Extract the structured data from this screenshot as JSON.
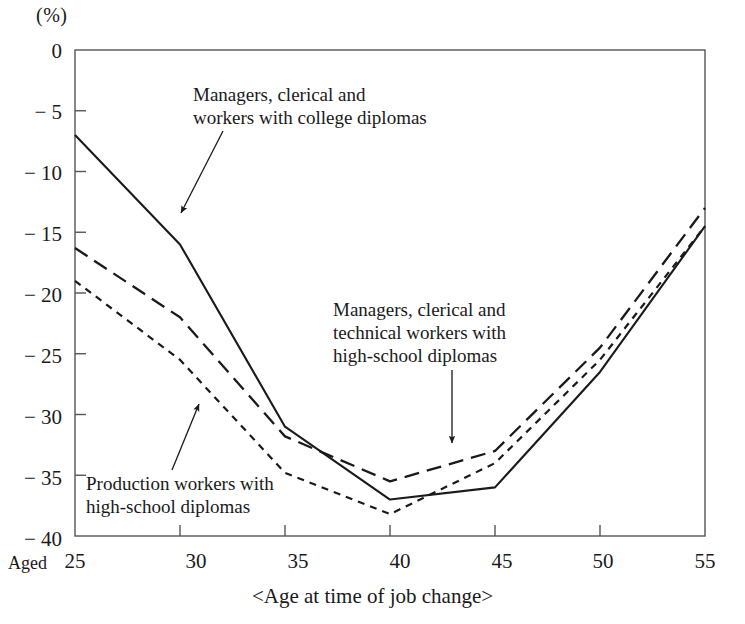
{
  "axes": {
    "unit_label": "(%)",
    "x_axis_title": "<Age at time of job change>",
    "aged_prefix": "Aged",
    "y_ticks": [
      "0",
      "− 5",
      "− 10",
      "− 15",
      "− 20",
      "− 25",
      "− 30",
      "− 35",
      "− 40"
    ],
    "x_ticks": [
      "25",
      "30",
      "35",
      "40",
      "45",
      "50",
      "55"
    ]
  },
  "annotations": {
    "college": "Managers, clerical and\nworkers with college diplomas",
    "hs_manager": "Managers, clerical and\ntechnical workers with\nhigh-school diplomas",
    "production": "Production workers with\nhigh-school diplomas"
  },
  "chart_data": {
    "type": "line",
    "title": "",
    "subtitle": "",
    "xlabel": "<Age at time of job change>",
    "ylabel": "(%)",
    "xlim": [
      25,
      55
    ],
    "ylim": [
      -40,
      0
    ],
    "grid": false,
    "legend_position": "inline-annotations",
    "x": [
      25,
      30,
      35,
      40,
      45,
      50,
      55
    ],
    "series": [
      {
        "name": "Managers, clerical and technical workers with college diplomas",
        "style": "solid",
        "color": "#1a1a1a",
        "values": [
          -7.0,
          -16.0,
          -31.0,
          -37.0,
          -36.0,
          -26.5,
          -14.5
        ]
      },
      {
        "name": "Managers, clerical and technical workers with high-school diplomas",
        "style": "long-dash",
        "color": "#1a1a1a",
        "values": [
          -16.3,
          -22.0,
          -31.8,
          -35.5,
          -33.0,
          -24.5,
          -13.0
        ]
      },
      {
        "name": "Production workers with high-school diplomas",
        "style": "short-dash",
        "color": "#1a1a1a",
        "values": [
          -19.0,
          -25.5,
          -34.8,
          -38.2,
          -34.0,
          -25.5,
          -14.5
        ]
      }
    ],
    "annotation_arrows": [
      {
        "label": "college",
        "target_x": 30,
        "target_y": -16.0
      },
      {
        "label": "hs_manager",
        "target_x": 42.3,
        "target_y": -34.4
      },
      {
        "label": "production",
        "target_x": 30.5,
        "target_y": -29.3
      }
    ]
  }
}
